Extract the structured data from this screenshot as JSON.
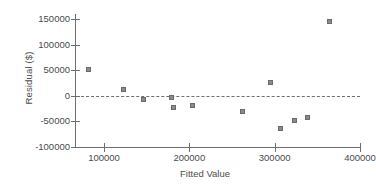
{
  "chart_data": {
    "type": "scatter",
    "title": "",
    "xlabel": "Fitted Value",
    "ylabel": "Residual ($)",
    "xlim": [
      66000,
      400000
    ],
    "ylim": [
      -100000,
      160000
    ],
    "xticks": [
      100000,
      200000,
      300000,
      400000
    ],
    "xtick_labels": [
      "100000",
      "200000",
      "300000",
      "400000"
    ],
    "yticks": [
      -100000,
      -50000,
      0,
      50000,
      100000,
      150000
    ],
    "ytick_labels": [
      "-100000",
      "-50000",
      "0",
      "50000",
      "100000",
      "150000"
    ],
    "grid": false,
    "legend": null,
    "reference_line": {
      "type": "horizontal",
      "value": 0,
      "style": "dashed",
      "color": "#6f6f6f"
    },
    "marker": {
      "shape": "square",
      "fill_color": "#8a8a8a",
      "edge_color": "#6a6a6a",
      "size_px": 5
    },
    "points": [
      {
        "x": 82000,
        "y": 51000
      },
      {
        "x": 124000,
        "y": 11000
      },
      {
        "x": 147000,
        "y": -8000
      },
      {
        "x": 180000,
        "y": -4000
      },
      {
        "x": 182000,
        "y": -23000
      },
      {
        "x": 204000,
        "y": -19000
      },
      {
        "x": 263000,
        "y": -32000
      },
      {
        "x": 296000,
        "y": 26000
      },
      {
        "x": 308000,
        "y": -64000
      },
      {
        "x": 324000,
        "y": -49000
      },
      {
        "x": 339000,
        "y": -43000
      },
      {
        "x": 365000,
        "y": 145000
      }
    ]
  },
  "axis": {
    "color": "#6d6d6d",
    "text_color": "#4b4b4b"
  }
}
